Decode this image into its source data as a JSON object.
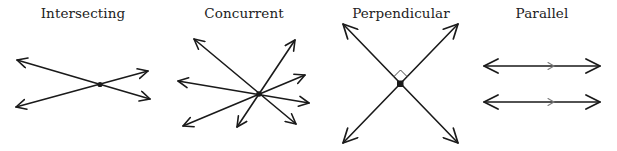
{
  "figure": {
    "panels": [
      {
        "id": "intersecting",
        "title": "Intersecting",
        "center_x": 83
      },
      {
        "id": "concurrent",
        "title": "Concurrent",
        "center_x": 244
      },
      {
        "id": "perpendicular",
        "title": "Perpendicular",
        "center_x": 401
      },
      {
        "id": "parallel",
        "title": "Parallel",
        "center_x": 542
      }
    ],
    "colors": {
      "line": "#1a1a1a",
      "title": "#222222",
      "parallel_mark": "#7a7a7a",
      "background": "#ffffff"
    }
  }
}
